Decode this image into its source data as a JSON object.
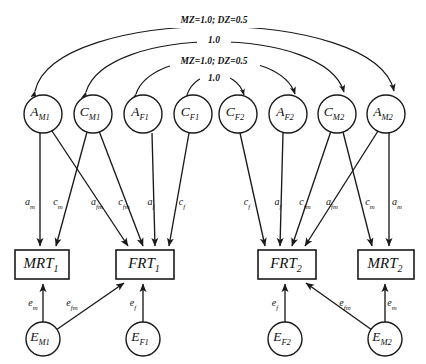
{
  "diagram": {
    "type": "path-diagram",
    "width": 426,
    "height": 364,
    "colors": {
      "stroke": "#1a1a1a",
      "background": "#ffffff",
      "text": "#111111"
    }
  },
  "latent_nodes": [
    {
      "id": "A_M1",
      "base": "A",
      "sub": "M1",
      "cx": 43,
      "cy": 114,
      "r": 19
    },
    {
      "id": "C_M1",
      "base": "C",
      "sub": "M1",
      "cx": 93,
      "cy": 114,
      "r": 19
    },
    {
      "id": "A_F1",
      "base": "A",
      "sub": "F1",
      "cx": 143,
      "cy": 114,
      "r": 19
    },
    {
      "id": "C_F1",
      "base": "C",
      "sub": "F1",
      "cx": 193,
      "cy": 114,
      "r": 19
    },
    {
      "id": "C_F2",
      "base": "C",
      "sub": "F2",
      "cx": 238,
      "cy": 114,
      "r": 19
    },
    {
      "id": "A_F2",
      "base": "A",
      "sub": "F2",
      "cx": 288,
      "cy": 114,
      "r": 19
    },
    {
      "id": "C_M2",
      "base": "C",
      "sub": "M2",
      "cx": 337,
      "cy": 114,
      "r": 19
    },
    {
      "id": "A_M2",
      "base": "A",
      "sub": "M2",
      "cx": 386,
      "cy": 114,
      "r": 19
    }
  ],
  "error_nodes": [
    {
      "id": "E_M1",
      "base": "E",
      "sub": "M1",
      "cx": 43,
      "cy": 339,
      "r": 17
    },
    {
      "id": "E_F1",
      "base": "E",
      "sub": "F1",
      "cx": 143,
      "cy": 339,
      "r": 17
    },
    {
      "id": "E_F2",
      "base": "E",
      "sub": "F2",
      "cx": 285,
      "cy": 339,
      "r": 17
    },
    {
      "id": "E_M2",
      "base": "E",
      "sub": "M2",
      "cx": 385,
      "cy": 339,
      "r": 17
    }
  ],
  "observed_nodes": [
    {
      "id": "MRT1",
      "base": "MRT",
      "sub": "1",
      "x": 15,
      "y": 250,
      "w": 54,
      "h": 29
    },
    {
      "id": "FRT1",
      "base": "FRT",
      "sub": "1",
      "x": 116,
      "y": 250,
      "w": 58,
      "h": 29
    },
    {
      "id": "FRT2",
      "base": "FRT",
      "sub": "2",
      "x": 258,
      "y": 250,
      "w": 58,
      "h": 29
    },
    {
      "id": "MRT2",
      "base": "MRT",
      "sub": "2",
      "x": 358,
      "y": 250,
      "w": 56,
      "h": 29
    }
  ],
  "correlation_arcs": [
    {
      "id": "arc-AM1-AM2",
      "label": "MZ=1.0;  DZ=0.5",
      "from": "A_M1",
      "to": "A_M2",
      "label_x": 214,
      "label_y": 21
    },
    {
      "id": "arc-CM1-CM2",
      "label": "1.0",
      "from": "C_M1",
      "to": "C_M2",
      "label_x": 214,
      "label_y": 41
    },
    {
      "id": "arc-AF1-AF2",
      "label": "MZ=1.0;  DZ=0.5",
      "from": "A_F1",
      "to": "A_F2",
      "label_x": 214,
      "label_y": 62
    },
    {
      "id": "arc-CF1-CF2",
      "label": "1.0",
      "from": "C_F1",
      "to": "C_F2",
      "label_x": 214,
      "label_y": 79
    }
  ],
  "path_labels": [
    {
      "id": "p-am-left",
      "base": "a",
      "sub": "m",
      "x": 30,
      "y": 203
    },
    {
      "id": "p-cm-left",
      "base": "c",
      "sub": "m",
      "x": 58,
      "y": 203
    },
    {
      "id": "p-afm-left",
      "base": "a",
      "sub": "fm",
      "x": 97,
      "y": 203
    },
    {
      "id": "p-cfm-left",
      "base": "c",
      "sub": "fm",
      "x": 124,
      "y": 203
    },
    {
      "id": "p-af-left",
      "base": "a",
      "sub": "f",
      "x": 151,
      "y": 203
    },
    {
      "id": "p-cf-left",
      "base": "c",
      "sub": "f",
      "x": 182,
      "y": 203
    },
    {
      "id": "p-cf-right",
      "base": "c",
      "sub": "f",
      "x": 247,
      "y": 203
    },
    {
      "id": "p-af-right",
      "base": "a",
      "sub": "f",
      "x": 278,
      "y": 203
    },
    {
      "id": "p-cfm-right",
      "base": "c",
      "sub": "fm",
      "x": 305,
      "y": 203
    },
    {
      "id": "p-afm-right",
      "base": "a",
      "sub": "fm",
      "x": 332,
      "y": 203
    },
    {
      "id": "p-cm-right",
      "base": "c",
      "sub": "m",
      "x": 370,
      "y": 203
    },
    {
      "id": "p-am-right",
      "base": "a",
      "sub": "m",
      "x": 397,
      "y": 203
    }
  ],
  "error_path_labels": [
    {
      "id": "e-em-left",
      "base": "e",
      "sub": "m",
      "x": 33,
      "y": 304
    },
    {
      "id": "e-efm-left",
      "base": "e",
      "sub": "fm",
      "x": 72,
      "y": 304
    },
    {
      "id": "e-ef-left",
      "base": "e",
      "sub": "f",
      "x": 133,
      "y": 304
    },
    {
      "id": "e-ef-right",
      "base": "e",
      "sub": "f",
      "x": 275,
      "y": 304
    },
    {
      "id": "e-efm-right",
      "base": "e",
      "sub": "fm",
      "x": 345,
      "y": 304
    },
    {
      "id": "e-em-right",
      "base": "e",
      "sub": "m",
      "x": 392,
      "y": 304
    }
  ]
}
